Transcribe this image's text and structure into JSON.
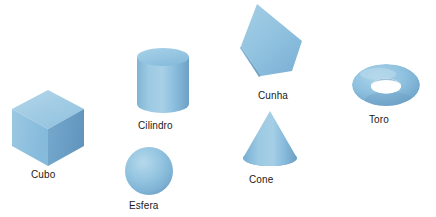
{
  "figure": {
    "kind": "3d-primitive-shapes-diagram",
    "background_color": "#ffffff",
    "label_color": "#1a1a1a",
    "palette": {
      "base": "#8CBFDE",
      "light": "#A4CDE6",
      "mid": "#7FB4D6",
      "dark": "#6B9FC4",
      "darker": "#5E93BA",
      "highlight": "#B9DAEA",
      "outline": "#6FA5C8"
    }
  },
  "shapes": [
    {
      "id": "cube",
      "label": "Cubo",
      "type": "cube",
      "label_x": 31,
      "label_y": 169
    },
    {
      "id": "cylinder",
      "label": "Cilindro",
      "type": "cylinder",
      "label_x": 138,
      "label_y": 120
    },
    {
      "id": "sphere",
      "label": "Esfera",
      "type": "sphere",
      "label_x": 129,
      "label_y": 200
    },
    {
      "id": "wedge",
      "label": "Cunha",
      "type": "wedge",
      "label_x": 258,
      "label_y": 90
    },
    {
      "id": "cone",
      "label": "Cone",
      "type": "cone",
      "label_x": 249,
      "label_y": 174
    },
    {
      "id": "torus",
      "label": "Toro",
      "type": "torus",
      "label_x": 369,
      "label_y": 114
    }
  ]
}
